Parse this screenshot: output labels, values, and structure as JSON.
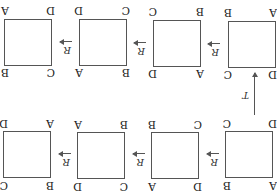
{
  "diagram": {
    "orientation": "rotated-180",
    "top_row": [
      {
        "tl": "A",
        "tr": "B",
        "bl": "D",
        "br": "C"
      },
      {
        "tl": "D",
        "tr": "A",
        "bl": "C",
        "br": "B"
      },
      {
        "tl": "C",
        "tr": "D",
        "bl": "B",
        "br": "A"
      },
      {
        "tl": "B",
        "tr": "C",
        "bl": "A",
        "br": "D"
      }
    ],
    "bottom_row": [
      {
        "tl": "D",
        "tr": "C",
        "bl": "A",
        "br": "B"
      },
      {
        "tl": "A",
        "tr": "D",
        "bl": "B",
        "br": "C"
      },
      {
        "tl": "B",
        "tr": "A",
        "bl": "C",
        "br": "D"
      },
      {
        "tl": "C",
        "tr": "B",
        "bl": "D",
        "br": "A"
      }
    ],
    "horizontal_arrow_label": "R",
    "vertical_arrow_label": "T",
    "line_color": "#555555"
  }
}
